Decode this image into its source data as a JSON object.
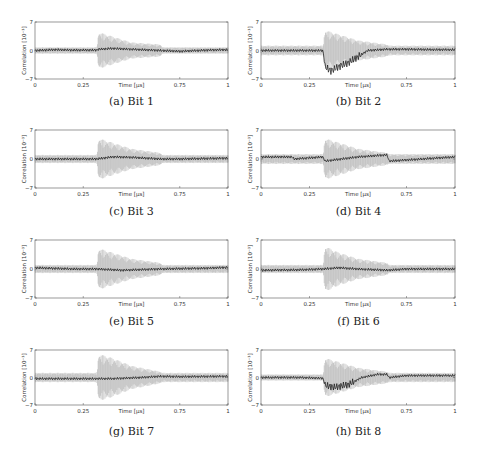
{
  "figure": {
    "panels": [
      {
        "id": "a",
        "caption": "(a) Bit 1"
      },
      {
        "id": "b",
        "caption": "(b) Bit 2"
      },
      {
        "id": "c",
        "caption": "(c) Bit 3"
      },
      {
        "id": "d",
        "caption": "(d) Bit 4"
      },
      {
        "id": "e",
        "caption": "(e) Bit 5"
      },
      {
        "id": "f",
        "caption": "(f) Bit 6"
      },
      {
        "id": "g",
        "caption": "(g) Bit 7"
      },
      {
        "id": "h",
        "caption": "(h) Bit 8"
      }
    ],
    "colors": {
      "envelope": "#b4b4b4",
      "correlation": "#111111",
      "axis": "#555555"
    }
  },
  "chart_data": [
    {
      "type": "line",
      "title": "(a) Bit 1",
      "xlabel": "Time [µs]",
      "ylabel": "Correlation [10⁻³]",
      "xticks": [
        "0",
        "0.25",
        "0.75",
        "1"
      ],
      "yticks": [
        "-7",
        "0",
        "7"
      ],
      "xlim": [
        0,
        1
      ],
      "ylim": [
        -7,
        7
      ],
      "grid": false,
      "series": [
        {
          "name": "correct key",
          "x": [
            0,
            0.1,
            0.2,
            0.32,
            0.33,
            0.4,
            0.5,
            0.65,
            0.75,
            0.9,
            1
          ],
          "values": [
            0,
            0.2,
            0.1,
            0.1,
            0.3,
            0.5,
            0.3,
            0,
            -0.2,
            0.1,
            0.2
          ]
        },
        {
          "name": "other keys envelope",
          "x": [
            0,
            0.32,
            0.33,
            0.4,
            0.5,
            0.65,
            0.66,
            1
          ],
          "values": [
            0.8,
            0.8,
            4.5,
            3.5,
            2,
            1.5,
            0.8,
            0.8
          ]
        }
      ]
    },
    {
      "type": "line",
      "title": "(b) Bit 2",
      "xlabel": "Time [µs]",
      "ylabel": "Correlation [10⁻³]",
      "xticks": [
        "0",
        "0.25",
        "0.75",
        "1"
      ],
      "yticks": [
        "-7",
        "0",
        "7"
      ],
      "xlim": [
        0,
        1
      ],
      "ylim": [
        -7,
        7
      ],
      "grid": false,
      "series": [
        {
          "name": "correct key",
          "x": [
            0,
            0.1,
            0.2,
            0.32,
            0.33,
            0.36,
            0.4,
            0.45,
            0.5,
            0.55,
            0.65,
            0.75,
            0.9,
            1
          ],
          "values": [
            0,
            0,
            0,
            0,
            -4,
            -5,
            -4,
            -3,
            -1.5,
            0,
            0.3,
            0.3,
            0.2,
            0.2
          ]
        },
        {
          "name": "other keys envelope",
          "x": [
            0,
            0.32,
            0.33,
            0.4,
            0.5,
            0.65,
            0.66,
            1
          ],
          "values": [
            1.2,
            1.2,
            5,
            4,
            2.5,
            1.5,
            1.2,
            1.2
          ]
        }
      ]
    },
    {
      "type": "line",
      "title": "(c) Bit 3",
      "xlabel": "Time [µs]",
      "ylabel": "Correlation [10⁻³]",
      "xticks": [
        "0",
        "0.25",
        "0.75",
        "1"
      ],
      "yticks": [
        "-7",
        "0",
        "7"
      ],
      "xlim": [
        0,
        1
      ],
      "ylim": [
        -7,
        7
      ],
      "grid": false,
      "series": [
        {
          "name": "correct key",
          "x": [
            0,
            0.2,
            0.32,
            0.4,
            0.5,
            0.65,
            0.75,
            1
          ],
          "values": [
            0,
            0,
            0,
            0.5,
            0.4,
            0,
            0,
            0.2
          ]
        },
        {
          "name": "other keys envelope",
          "x": [
            0,
            0.32,
            0.33,
            0.4,
            0.5,
            0.65,
            0.66,
            1
          ],
          "values": [
            1,
            1,
            5,
            4,
            2.5,
            1.5,
            1,
            1
          ]
        }
      ]
    },
    {
      "type": "line",
      "title": "(d) Bit 4",
      "xlabel": "Time [µs]",
      "ylabel": "Correlation [10⁻³]",
      "xticks": [
        "0",
        "0.25",
        "0.75",
        "1"
      ],
      "yticks": [
        "-7",
        "0",
        "7"
      ],
      "xlim": [
        0,
        1
      ],
      "ylim": [
        -7,
        7
      ],
      "grid": false,
      "series": [
        {
          "name": "correct key",
          "x": [
            0,
            0.16,
            0.17,
            0.32,
            0.33,
            0.5,
            0.65,
            0.66,
            1
          ],
          "values": [
            0.5,
            0.5,
            0,
            0.5,
            -0.5,
            0.5,
            1,
            -0.5,
            0.5
          ]
        },
        {
          "name": "other keys envelope",
          "x": [
            0,
            0.32,
            0.33,
            0.4,
            0.5,
            0.65,
            0.66,
            1
          ],
          "values": [
            1.2,
            1.2,
            5,
            4,
            2.5,
            1.5,
            1.2,
            1.2
          ]
        }
      ]
    },
    {
      "type": "line",
      "title": "(e) Bit 5",
      "xlabel": "Time [µs]",
      "ylabel": "Correlation [10⁻³]",
      "xticks": [
        "0",
        "0.25",
        "0.75",
        "1"
      ],
      "yticks": [
        "-7",
        "0",
        "7"
      ],
      "xlim": [
        0,
        1
      ],
      "ylim": [
        -7,
        7
      ],
      "grid": false,
      "series": [
        {
          "name": "correct key",
          "x": [
            0,
            0.2,
            0.32,
            0.45,
            0.65,
            0.9,
            1
          ],
          "values": [
            0.3,
            0,
            0,
            -0.3,
            0,
            0.2,
            0.4
          ]
        },
        {
          "name": "other keys envelope",
          "x": [
            0,
            0.32,
            0.33,
            0.4,
            0.5,
            0.65,
            0.66,
            1
          ],
          "values": [
            1,
            1,
            5,
            4,
            2.5,
            1.5,
            1,
            1
          ]
        }
      ]
    },
    {
      "type": "line",
      "title": "(f) Bit 6",
      "xlabel": "Time [µs]",
      "ylabel": "Correlation [10⁻³]",
      "xticks": [
        "0",
        "0.25",
        "0.75",
        "1"
      ],
      "yticks": [
        "-7",
        "0",
        "7"
      ],
      "xlim": [
        0,
        1
      ],
      "ylim": [
        -7,
        7
      ],
      "grid": false,
      "series": [
        {
          "name": "correct key",
          "x": [
            0,
            0.2,
            0.32,
            0.4,
            0.5,
            0.65,
            0.75,
            1
          ],
          "values": [
            -0.3,
            -0.2,
            0,
            0.3,
            0,
            -0.3,
            0,
            0
          ]
        },
        {
          "name": "other keys envelope",
          "x": [
            0,
            0.32,
            0.33,
            0.4,
            0.5,
            0.65,
            0.66,
            1
          ],
          "values": [
            1,
            1,
            5.5,
            4,
            2.5,
            1.5,
            1,
            1
          ]
        }
      ]
    },
    {
      "type": "line",
      "title": "(g) Bit 7",
      "xlabel": "Time [µs]",
      "ylabel": "Correlation [10⁻³]",
      "xticks": [
        "0",
        "0.25",
        "0.75",
        "1"
      ],
      "yticks": [
        "-7",
        "0",
        "7"
      ],
      "xlim": [
        0,
        1
      ],
      "ylim": [
        -7,
        7
      ],
      "grid": false,
      "series": [
        {
          "name": "correct key",
          "x": [
            0,
            0.2,
            0.32,
            0.4,
            0.55,
            0.65,
            0.75,
            1
          ],
          "values": [
            -0.3,
            -0.3,
            -0.3,
            -0.3,
            0,
            0.3,
            0.2,
            0.3
          ]
        },
        {
          "name": "other keys envelope",
          "x": [
            0,
            0.32,
            0.33,
            0.4,
            0.5,
            0.65,
            0.66,
            1
          ],
          "values": [
            1.2,
            1.2,
            6,
            5,
            3,
            1.5,
            1.2,
            1.2
          ]
        }
      ]
    },
    {
      "type": "line",
      "title": "(h) Bit 8",
      "xlabel": "Time [µs]",
      "ylabel": "Correlation [10⁻³]",
      "xticks": [
        "0",
        "0.25",
        "0.75",
        "1"
      ],
      "yticks": [
        "-7",
        "0",
        "7"
      ],
      "xlim": [
        0,
        1
      ],
      "ylim": [
        -7,
        7
      ],
      "grid": false,
      "series": [
        {
          "name": "correct key",
          "x": [
            0,
            0.2,
            0.32,
            0.33,
            0.38,
            0.45,
            0.52,
            0.6,
            0.65,
            0.66,
            0.75,
            1
          ],
          "values": [
            0,
            0,
            -0.2,
            -2,
            -2.5,
            -1.8,
            0,
            0.8,
            0.8,
            0,
            0.5,
            0.5
          ]
        },
        {
          "name": "other keys envelope",
          "x": [
            0,
            0.32,
            0.33,
            0.4,
            0.5,
            0.65,
            0.66,
            1
          ],
          "values": [
            0.8,
            0.8,
            5,
            4,
            2.5,
            1.5,
            1.2,
            1.2
          ]
        }
      ]
    }
  ]
}
